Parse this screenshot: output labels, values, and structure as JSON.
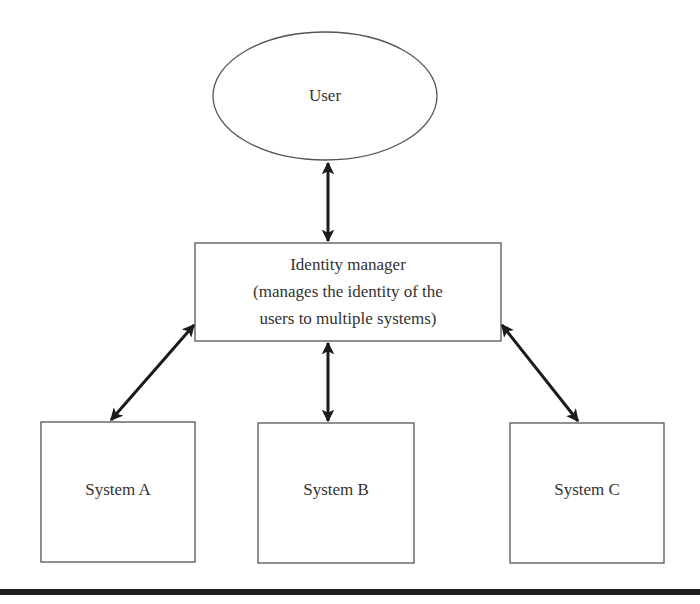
{
  "diagram": {
    "nodes": {
      "user": {
        "label": "User",
        "shape": "ellipse"
      },
      "identity_manager": {
        "shape": "rectangle",
        "lines": [
          "Identity manager",
          "(manages the identity of the",
          "users to multiple systems)"
        ]
      },
      "system_a": {
        "label": "System A",
        "shape": "rectangle"
      },
      "system_b": {
        "label": "System B",
        "shape": "rectangle"
      },
      "system_c": {
        "label": "System C",
        "shape": "rectangle"
      }
    },
    "edges": [
      {
        "from": "user",
        "to": "identity_manager",
        "direction": "bidirectional"
      },
      {
        "from": "identity_manager",
        "to": "system_a",
        "direction": "bidirectional"
      },
      {
        "from": "identity_manager",
        "to": "system_b",
        "direction": "bidirectional"
      },
      {
        "from": "identity_manager",
        "to": "system_c",
        "direction": "bidirectional"
      }
    ],
    "colors": {
      "stroke": "#555555",
      "arrow": "#1a1a1a",
      "text": "#333333",
      "rule": "#1f1f1f",
      "background": "#ffffff"
    }
  }
}
